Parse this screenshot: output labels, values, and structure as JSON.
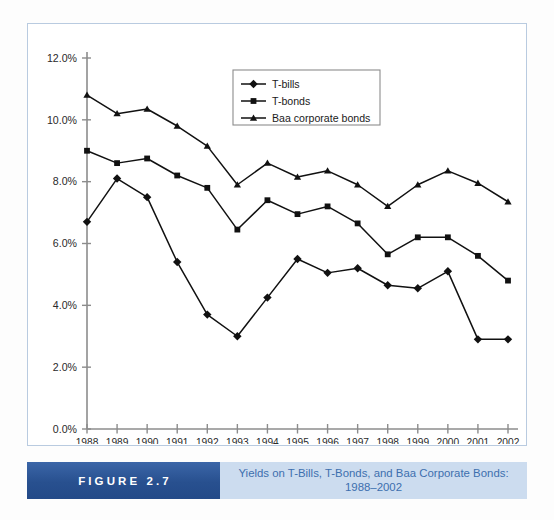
{
  "figure": {
    "tag": "FIGURE 2.7",
    "caption_line1": "Yields on T-Bills, T-Bonds, and Baa Corporate Bonds:",
    "caption_line2": "1988–2002"
  },
  "colors": {
    "frame_border": "#b9cbe0",
    "figure_tag_bg": "#2b569c",
    "figure_tag_text": "#ffffff",
    "caption_bg": "#ccdcef",
    "caption_text": "#3d6fae",
    "axis": "#8c8c8c",
    "series_line": "#111111",
    "plot_bg": "#ffffff"
  },
  "chart_data": {
    "type": "line",
    "title": "Yields on T-Bills, T-Bonds, and Baa Corporate Bonds: 1988–2002",
    "xlabel": "",
    "ylabel": "",
    "grid": false,
    "legend_position": "top-right",
    "x": [
      1988,
      1989,
      1990,
      1991,
      1992,
      1993,
      1994,
      1995,
      1996,
      1997,
      1998,
      1999,
      2000,
      2001,
      2002
    ],
    "categories": [
      "1988",
      "1989",
      "1990",
      "1991",
      "1992",
      "1993",
      "1994",
      "1995",
      "1996",
      "1997",
      "1998",
      "1999",
      "2000",
      "2001",
      "2002"
    ],
    "xtick_labels": [
      "1988",
      "1989",
      "1990",
      "1991",
      "1992",
      "1993",
      "1994",
      "1995",
      "1996",
      "1997",
      "1998",
      "1999",
      "2000",
      "2001",
      "2002"
    ],
    "ytick_labels": [
      "0.0%",
      "2.0%",
      "4.0%",
      "6.0%",
      "8.0%",
      "10.0%",
      "12.0%"
    ],
    "yticks": [
      0,
      2,
      4,
      6,
      8,
      10,
      12
    ],
    "ylim": [
      0,
      12
    ],
    "y_unit": "%",
    "series": [
      {
        "name": "T-bills",
        "marker": "diamond",
        "values": [
          6.7,
          8.1,
          7.5,
          5.4,
          3.7,
          3.0,
          4.25,
          5.5,
          5.05,
          5.2,
          4.65,
          4.55,
          5.1,
          2.9,
          2.9
        ]
      },
      {
        "name": "T-bonds",
        "marker": "square",
        "values": [
          9.0,
          8.6,
          8.75,
          8.2,
          7.8,
          6.45,
          7.4,
          6.95,
          7.2,
          6.65,
          5.65,
          6.2,
          6.2,
          5.6,
          4.8
        ]
      },
      {
        "name": "Baa corporate bonds",
        "marker": "triangle",
        "values": [
          10.8,
          10.2,
          10.35,
          9.8,
          9.15,
          7.9,
          8.6,
          8.15,
          8.35,
          7.9,
          7.2,
          7.9,
          8.35,
          7.95,
          7.35
        ]
      }
    ],
    "legend": [
      "T-bills",
      "T-bonds",
      "Baa corporate bonds"
    ]
  }
}
